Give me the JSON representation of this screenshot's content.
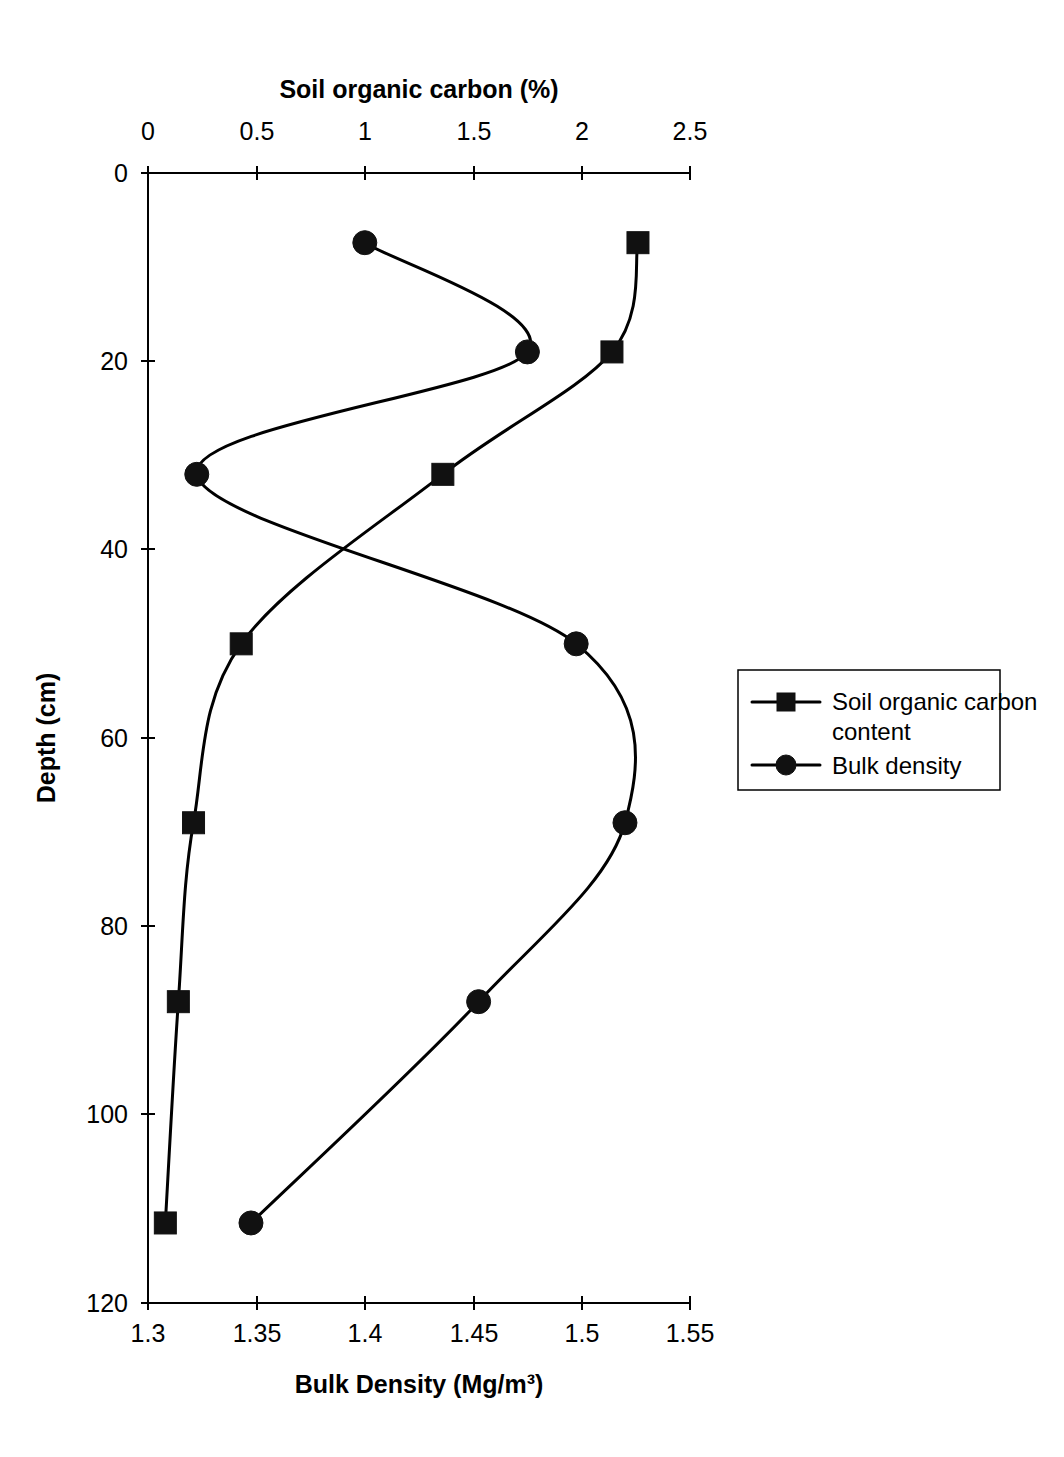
{
  "chart_data": {
    "type": "line",
    "title": "",
    "orientation": "depth-profile",
    "top_axis": {
      "label": "Soil organic carbon (%)",
      "ticks": [
        "0",
        "0.5",
        "1",
        "1.5",
        "2",
        "2.5"
      ],
      "tick_values": [
        0,
        0.5,
        1,
        1.5,
        2,
        2.5
      ],
      "range": [
        0,
        2.5
      ]
    },
    "bottom_axis": {
      "label": "Bulk Density (Mg/m³)",
      "ticks": [
        "1.3",
        "1.35",
        "1.4",
        "1.45",
        "1.5",
        "1.55"
      ],
      "tick_values": [
        1.3,
        1.35,
        1.4,
        1.45,
        1.5,
        1.55
      ],
      "range": [
        1.3,
        1.55
      ]
    },
    "y_axis": {
      "label": "Depth (cm)",
      "ticks": [
        "0",
        "20",
        "40",
        "60",
        "80",
        "100",
        "120"
      ],
      "tick_values": [
        0,
        20,
        40,
        60,
        80,
        100,
        120
      ],
      "range": [
        0,
        120
      ],
      "inverted": true
    },
    "grid": false,
    "legend_position": "right",
    "series": [
      {
        "name": "Soil organic carbon content",
        "marker": "square",
        "axis": "top",
        "depth": [
          7.4,
          19,
          32,
          50,
          69,
          88,
          111.5
        ],
        "values": [
          2.26,
          2.14,
          1.36,
          0.43,
          0.21,
          0.14,
          0.08
        ]
      },
      {
        "name": "Bulk density",
        "marker": "circle",
        "axis": "bottom",
        "depth": [
          7.4,
          19,
          32,
          50,
          69,
          88,
          111.5
        ],
        "values": [
          1.4,
          1.475,
          1.3225,
          1.4975,
          1.52,
          1.4525,
          1.3475
        ]
      }
    ]
  },
  "legend": {
    "entries": [
      {
        "label": "Soil organic carbon content",
        "marker": "square"
      },
      {
        "label": "Bulk density",
        "marker": "circle"
      }
    ]
  },
  "colors": {
    "line": "#000000",
    "marker": "#111111",
    "background": "#ffffff"
  }
}
